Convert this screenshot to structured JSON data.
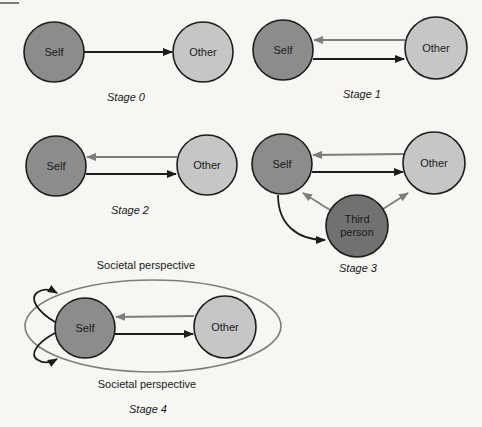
{
  "colors": {
    "background": "#f6f6f3",
    "self_fill": "#8c8c8c",
    "other_fill": "#c6c6c6",
    "third_fill": "#717171",
    "outline": "#1c1c1c",
    "black_arrow": "#1c1c1c",
    "grey_arrow": "#7d7d7d",
    "ellipse": "#7d7d7d"
  },
  "stages": [
    {
      "label": "Stage 0",
      "self": "Self",
      "other": "Other"
    },
    {
      "label": "Stage 1",
      "self": "Self",
      "other": "Other"
    },
    {
      "label": "Stage 2",
      "self": "Self",
      "other": "Other"
    },
    {
      "label": "Stage 3",
      "self": "Self",
      "other": "Other",
      "third_line1": "Third",
      "third_line2": "person"
    },
    {
      "label": "Stage 4",
      "self": "Self",
      "other": "Other",
      "perspective_top": "Societal perspective",
      "perspective_bottom": "Societal perspective"
    }
  ]
}
